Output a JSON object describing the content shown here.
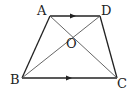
{
  "diagram": {
    "type": "trapezoid",
    "colors": {
      "stroke": "#222222",
      "diagonal": "#555555",
      "background": "#ffffff"
    },
    "vertices": {
      "A": {
        "label": "A",
        "x": 50,
        "y": 16
      },
      "D": {
        "label": "D",
        "x": 100,
        "y": 16
      },
      "B": {
        "label": "B",
        "x": 22,
        "y": 78
      },
      "C": {
        "label": "C",
        "x": 117,
        "y": 78
      },
      "O": {
        "label": "O",
        "x": 72,
        "y": 36
      }
    },
    "parallel_marks": [
      "AD",
      "BC"
    ]
  }
}
